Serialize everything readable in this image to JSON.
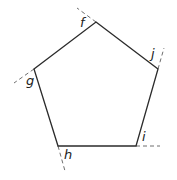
{
  "diagram": {
    "type": "pentagon-exterior-angles",
    "colors": {
      "line": "#2b2b2b",
      "extension": "#6f6f6f",
      "label": "#222222",
      "background": "#ffffff"
    },
    "vertices": [
      {
        "id": "f",
        "label": "f",
        "x": 96,
        "y": 22,
        "label_x": 80,
        "label_y": 27
      },
      {
        "id": "j",
        "label": "j",
        "x": 158,
        "y": 69,
        "label_x": 151,
        "label_y": 58
      },
      {
        "id": "i",
        "label": "i",
        "x": 136,
        "y": 146,
        "label_x": 142,
        "label_y": 141
      },
      {
        "id": "h",
        "label": "h",
        "x": 58,
        "y": 146,
        "label_x": 64,
        "label_y": 159
      },
      {
        "id": "g",
        "label": "g",
        "x": 34,
        "y": 69,
        "label_x": 26,
        "label_y": 85
      }
    ],
    "extensions": [
      {
        "at": "f",
        "x1": 96,
        "y1": 22,
        "x2": 77,
        "y2": 8
      },
      {
        "at": "j",
        "x1": 158,
        "y1": 69,
        "x2": 164,
        "y2": 48
      },
      {
        "at": "i",
        "x1": 136,
        "y1": 146,
        "x2": 160,
        "y2": 146
      },
      {
        "at": "h",
        "x1": 58,
        "y1": 146,
        "x2": 65,
        "y2": 171
      },
      {
        "at": "g",
        "x1": 34,
        "y1": 69,
        "x2": 14,
        "y2": 83
      }
    ]
  }
}
